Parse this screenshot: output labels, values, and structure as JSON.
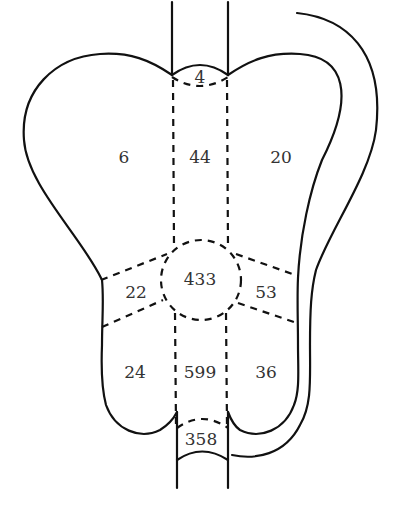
{
  "diagram": {
    "type": "segmented-organ-region-map",
    "line_color": "#111111",
    "label_color": "#333333",
    "regions": [
      {
        "id": "top-neck",
        "label": "4",
        "x": 200,
        "y": 77
      },
      {
        "id": "upper-left",
        "label": "6",
        "x": 124,
        "y": 157
      },
      {
        "id": "upper-middle",
        "label": "44",
        "x": 200,
        "y": 157
      },
      {
        "id": "upper-right",
        "label": "20",
        "x": 281,
        "y": 157
      },
      {
        "id": "center",
        "label": "433",
        "x": 200,
        "y": 279
      },
      {
        "id": "middle-left",
        "label": "22",
        "x": 136,
        "y": 292
      },
      {
        "id": "middle-right",
        "label": "53",
        "x": 266,
        "y": 292
      },
      {
        "id": "lower-left",
        "label": "24",
        "x": 135,
        "y": 372
      },
      {
        "id": "lower-middle",
        "label": "599",
        "x": 200,
        "y": 372
      },
      {
        "id": "lower-right",
        "label": "36",
        "x": 266,
        "y": 372
      },
      {
        "id": "bottom-neck",
        "label": "358",
        "x": 201,
        "y": 439
      }
    ]
  }
}
